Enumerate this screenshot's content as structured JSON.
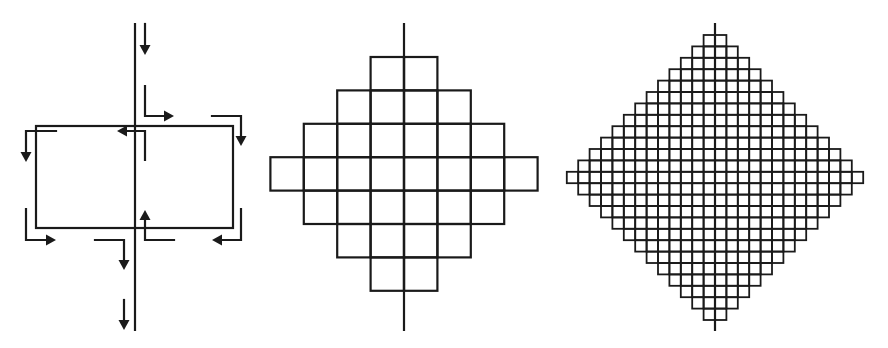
{
  "colors": {
    "stroke": "#1a1a1a",
    "background": "#ffffff"
  },
  "panels": [
    {
      "id": "panel-flow",
      "description": "Rectangle split by vertical axis with circulating L-shaped arrows",
      "axis": {
        "x": 135,
        "y1": 24,
        "y2": 330
      },
      "rect": {
        "x1": 36,
        "y1": 126,
        "x2": 233,
        "y2": 228
      },
      "arrows": [
        {
          "points": [
            [
              145,
              24
            ],
            [
              145,
              55
            ]
          ],
          "head": "down"
        },
        {
          "points": [
            [
              145,
              86
            ],
            [
              145,
              116
            ],
            [
              174,
              116
            ]
          ],
          "head": "right"
        },
        {
          "points": [
            [
              212,
              116
            ],
            [
              241,
              116
            ],
            [
              241,
              146
            ]
          ],
          "head": "down"
        },
        {
          "points": [
            [
              145,
              160
            ],
            [
              145,
              131
            ],
            [
              117,
              131
            ]
          ],
          "head": "left"
        },
        {
          "points": [
            [
              56,
              131
            ],
            [
              26,
              131
            ],
            [
              26,
              162
            ]
          ],
          "head": "down"
        },
        {
          "points": [
            [
              26,
              209
            ],
            [
              26,
              240
            ],
            [
              56,
              240
            ]
          ],
          "head": "right"
        },
        {
          "points": [
            [
              95,
              240
            ],
            [
              124,
              240
            ],
            [
              124,
              270
            ]
          ],
          "head": "down"
        },
        {
          "points": [
            [
              174,
              240
            ],
            [
              145,
              240
            ],
            [
              145,
              210
            ]
          ],
          "head": "up"
        },
        {
          "points": [
            [
              241,
              209
            ],
            [
              241,
              240
            ],
            [
              212,
              240
            ]
          ],
          "head": "left"
        },
        {
          "points": [
            [
              124,
              300
            ],
            [
              124,
              330
            ]
          ],
          "head": "down"
        }
      ]
    },
    {
      "id": "panel-coarse-grid",
      "description": "Diamond-shaped grid of squares, coarse resolution",
      "axis": {
        "x": 404,
        "y1": 24,
        "y2": 330
      },
      "center_x": 404,
      "top_y": 57,
      "cell": 33.4,
      "row_widths": [
        2,
        4,
        6,
        8,
        6,
        4,
        2
      ],
      "stroke_width": 2.2
    },
    {
      "id": "panel-fine-grid",
      "description": "Diamond-shaped grid of squares, fine resolution",
      "axis": {
        "x": 715,
        "y1": 24,
        "y2": 330
      },
      "center_x": 715,
      "top_y": 35,
      "cell": 11.4,
      "row_widths": [
        2,
        4,
        6,
        8,
        10,
        12,
        14,
        16,
        18,
        20,
        22,
        24,
        26,
        24,
        22,
        20,
        18,
        16,
        14,
        12,
        10,
        8,
        6,
        4,
        2
      ],
      "stroke_width": 1.8
    }
  ]
}
